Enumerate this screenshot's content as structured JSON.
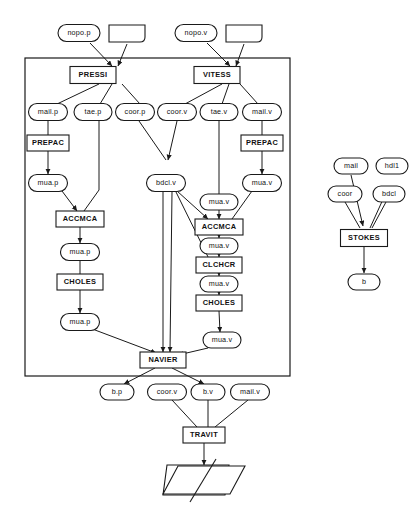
{
  "diagram": {
    "colors": {
      "stroke": "#1a1a1a",
      "fill": "#ffffff",
      "text": "#111111"
    },
    "frame": {
      "label": ""
    },
    "process_nodes": [
      {
        "id": "pressi",
        "label": "PRESSI",
        "x": 93,
        "y": 75,
        "w": 46,
        "h": 17
      },
      {
        "id": "vitess",
        "label": "VITESS",
        "x": 217,
        "y": 75,
        "w": 46,
        "h": 17
      },
      {
        "id": "prepac_p",
        "label": "PREPAC",
        "x": 48,
        "y": 143,
        "w": 42,
        "h": 16
      },
      {
        "id": "prepac_v",
        "label": "PREPAC",
        "x": 262,
        "y": 143,
        "w": 42,
        "h": 16
      },
      {
        "id": "accmca_p",
        "label": "ACCMCA",
        "x": 80,
        "y": 219,
        "w": 48,
        "h": 16
      },
      {
        "id": "accmca_v",
        "label": "ACCMCA",
        "x": 219,
        "y": 227,
        "w": 48,
        "h": 16
      },
      {
        "id": "choles_p",
        "label": "CHOLES",
        "x": 80,
        "y": 282,
        "w": 46,
        "h": 16
      },
      {
        "id": "clchcr",
        "label": "CLCHCR",
        "x": 219,
        "y": 265,
        "w": 46,
        "h": 16
      },
      {
        "id": "choles_v",
        "label": "CHOLES",
        "x": 219,
        "y": 303,
        "w": 46,
        "h": 16
      },
      {
        "id": "navier",
        "label": "NAVIER",
        "x": 163,
        "y": 360,
        "w": 46,
        "h": 16
      },
      {
        "id": "stokes",
        "label": "STOKES",
        "x": 364,
        "y": 238,
        "w": 47,
        "h": 17
      },
      {
        "id": "travit",
        "label": "TRAVIT",
        "x": 204,
        "y": 435,
        "w": 42,
        "h": 16
      }
    ],
    "data_nodes": [
      {
        "id": "nopo_p",
        "label": "nopo.p",
        "x": 79,
        "y": 33,
        "w": 42,
        "h": 17
      },
      {
        "id": "nopo_v",
        "label": "nopo.v",
        "x": 196,
        "y": 33,
        "w": 42,
        "h": 17
      },
      {
        "id": "mail_p",
        "label": "mail.p",
        "x": 48,
        "y": 112,
        "w": 39,
        "h": 17
      },
      {
        "id": "tae_p",
        "label": "tae.p",
        "x": 93,
        "y": 112,
        "w": 38,
        "h": 17
      },
      {
        "id": "coor_p",
        "label": "coor.p",
        "x": 135,
        "y": 112,
        "w": 39,
        "h": 17
      },
      {
        "id": "coor_v",
        "label": "coor.v",
        "x": 177,
        "y": 112,
        "w": 39,
        "h": 17
      },
      {
        "id": "tae_v",
        "label": "tae.v",
        "x": 219,
        "y": 112,
        "w": 38,
        "h": 17
      },
      {
        "id": "mail_v",
        "label": "mail.v",
        "x": 262,
        "y": 112,
        "w": 39,
        "h": 17
      },
      {
        "id": "mua_p1",
        "label": "mua.p",
        "x": 48,
        "y": 183,
        "w": 39,
        "h": 17
      },
      {
        "id": "bdcl_v",
        "label": "bdcl.v",
        "x": 166,
        "y": 183,
        "w": 39,
        "h": 17
      },
      {
        "id": "mua_v1",
        "label": "mua.v",
        "x": 262,
        "y": 183,
        "w": 39,
        "h": 17
      },
      {
        "id": "mua_v2",
        "label": "mua.v",
        "x": 219,
        "y": 202,
        "w": 38,
        "h": 16
      },
      {
        "id": "mua_p2",
        "label": "mua.p",
        "x": 80,
        "y": 252,
        "w": 39,
        "h": 17
      },
      {
        "id": "mua_v3",
        "label": "mua.v",
        "x": 219,
        "y": 246,
        "w": 38,
        "h": 16
      },
      {
        "id": "mua_v4",
        "label": "mua.v",
        "x": 219,
        "y": 284,
        "w": 38,
        "h": 16
      },
      {
        "id": "mua_p3",
        "label": "mua.p",
        "x": 80,
        "y": 322,
        "w": 39,
        "h": 17
      },
      {
        "id": "mua_v5",
        "label": "mua.v",
        "x": 222,
        "y": 340,
        "w": 38,
        "h": 16
      },
      {
        "id": "b_p",
        "label": "b.p",
        "x": 117,
        "y": 392,
        "w": 34,
        "h": 16
      },
      {
        "id": "coor_v2",
        "label": "coor.v",
        "x": 167,
        "y": 392,
        "w": 39,
        "h": 16
      },
      {
        "id": "b_v",
        "label": "b.v",
        "x": 208,
        "y": 392,
        "w": 34,
        "h": 16
      },
      {
        "id": "mail_v2",
        "label": "mail.v",
        "x": 250,
        "y": 392,
        "w": 39,
        "h": 16
      },
      {
        "id": "mail_s",
        "label": "mail",
        "x": 351,
        "y": 166,
        "w": 34,
        "h": 16
      },
      {
        "id": "hdl1_s",
        "label": "hdl1",
        "x": 392,
        "y": 166,
        "w": 32,
        "h": 16
      },
      {
        "id": "coor_s",
        "label": "coor",
        "x": 345,
        "y": 194,
        "w": 34,
        "h": 16
      },
      {
        "id": "bdcl_s",
        "label": "bdcl",
        "x": 389,
        "y": 194,
        "w": 32,
        "h": 16
      },
      {
        "id": "b_s",
        "label": "b",
        "x": 364,
        "y": 282,
        "w": 32,
        "h": 16
      }
    ],
    "plain_shapes": [
      {
        "id": "blank_p",
        "label": "",
        "x": 127,
        "y": 33
      },
      {
        "id": "blank_v",
        "label": "",
        "x": 244,
        "y": 33
      }
    ],
    "terminal_shape": {
      "id": "result-plane",
      "label": ""
    }
  }
}
